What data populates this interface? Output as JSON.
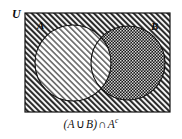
{
  "figure": {
    "type": "venn-diagram",
    "caption": "(A ∪ B) ∩ Aᶜ",
    "caption_parts": {
      "open_paren": "(",
      "set_a": "A",
      "union_symbol": "∪",
      "set_b": "B",
      "close_paren": ")",
      "intersection_symbol": "∩",
      "set_a2": "A",
      "complement_superscript": "c"
    },
    "labels": {
      "universe": "U",
      "circle_a": "A",
      "circle_b": "B"
    },
    "shaded_region_description": "B minus A",
    "colors": {
      "outline": "#111111",
      "universe_hatch": "#2b2b2b",
      "circle_a_hatch": "#6e6e6e",
      "shaded_dark": "#1e1e1e",
      "background": "#ffffff"
    },
    "geometry": {
      "rect": {
        "x": 25,
        "y": 13,
        "width": 145,
        "height": 99
      },
      "circle_a": {
        "cx": 73,
        "cy": 63,
        "r": 38
      },
      "circle_b": {
        "cx": 128,
        "cy": 63,
        "r": 37
      }
    }
  }
}
